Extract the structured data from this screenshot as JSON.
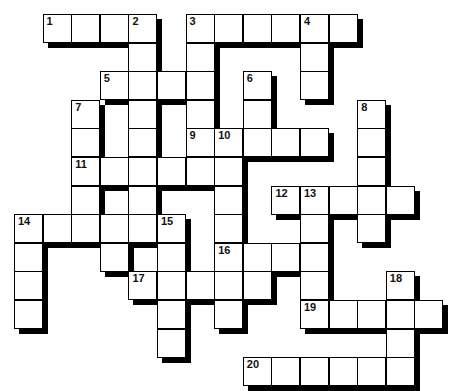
{
  "puzzle": {
    "type": "crossword",
    "cell_size": 28.6,
    "origin": [
      14,
      14
    ],
    "entries": [
      {
        "number": "1",
        "direction": "across",
        "row": 0,
        "col": 1,
        "length": 4
      },
      {
        "number": "2",
        "direction": "down",
        "row": 0,
        "col": 4,
        "length": 7
      },
      {
        "number": "3",
        "direction": "across",
        "row": 0,
        "col": 6,
        "length": 6
      },
      {
        "number": "3",
        "direction": "down",
        "row": 0,
        "col": 6,
        "length": 5
      },
      {
        "number": "4",
        "direction": "down",
        "row": 0,
        "col": 10,
        "length": 3
      },
      {
        "number": "5",
        "direction": "across",
        "row": 2,
        "col": 3,
        "length": 4
      },
      {
        "number": "6",
        "direction": "down",
        "row": 2,
        "col": 8,
        "length": 2
      },
      {
        "number": "7",
        "direction": "down",
        "row": 3,
        "col": 2,
        "length": 5
      },
      {
        "number": "8",
        "direction": "down",
        "row": 3,
        "col": 12,
        "length": 5
      },
      {
        "number": "9",
        "direction": "across",
        "row": 4,
        "col": 6,
        "length": 5
      },
      {
        "number": "10",
        "direction": "down",
        "row": 4,
        "col": 7,
        "length": 7
      },
      {
        "number": "11",
        "direction": "across",
        "row": 5,
        "col": 2,
        "length": 6
      },
      {
        "number": "12",
        "direction": "across",
        "row": 6,
        "col": 9,
        "length": 5
      },
      {
        "number": "13",
        "direction": "down",
        "row": 6,
        "col": 10,
        "length": 5
      },
      {
        "number": "14",
        "direction": "across",
        "row": 7,
        "col": 0,
        "length": 5
      },
      {
        "number": "14",
        "direction": "down",
        "row": 7,
        "col": 0,
        "length": 4
      },
      {
        "number": "15",
        "direction": "down",
        "row": 7,
        "col": 5,
        "length": 5
      },
      {
        "number": "16",
        "direction": "across",
        "row": 8,
        "col": 7,
        "length": 4
      },
      {
        "number": "17",
        "direction": "across",
        "row": 9,
        "col": 4,
        "length": 5
      },
      {
        "number": "18",
        "direction": "down",
        "row": 9,
        "col": 13,
        "length": 4
      },
      {
        "number": "19",
        "direction": "across",
        "row": 10,
        "col": 10,
        "length": 5
      },
      {
        "number": "20",
        "direction": "across",
        "row": 12,
        "col": 8,
        "length": 6
      }
    ],
    "extra_cells": [
      [
        8,
        3
      ]
    ]
  }
}
